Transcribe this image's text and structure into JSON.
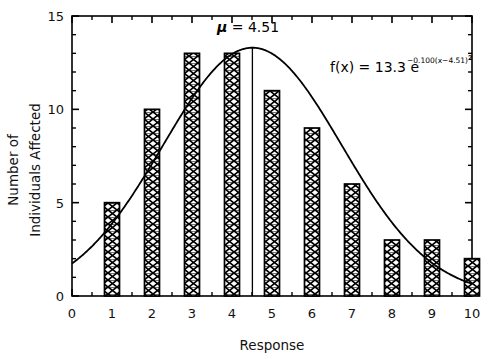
{
  "chart_data": {
    "type": "bar",
    "title": "",
    "xlabel": "Response",
    "ylabel": "Number of Individuals Affected",
    "ylabel_line1": "Number of",
    "ylabel_line2": "Individuals Affected",
    "categories": [
      "1",
      "2",
      "3",
      "4",
      "5",
      "6",
      "7",
      "8",
      "9",
      "10"
    ],
    "values": [
      5,
      10,
      13,
      13,
      11,
      9,
      6,
      3,
      3,
      2
    ],
    "x": [
      1,
      2,
      3,
      4,
      5,
      6,
      7,
      8,
      9,
      10
    ],
    "xlim": [
      0,
      10
    ],
    "ylim": [
      0,
      15
    ],
    "xticks": [
      "0",
      "1",
      "2",
      "3",
      "4",
      "5",
      "6",
      "7",
      "8",
      "9",
      "10"
    ],
    "yticks": [
      "0",
      "5",
      "10",
      "15"
    ],
    "y_minor_step": 1,
    "x_minor_step": 0.5,
    "grid": false,
    "legend": "none",
    "series": [
      {
        "name": "Number of Individuals Affected",
        "type": "bar",
        "values": [
          5,
          10,
          13,
          13,
          11,
          9,
          6,
          3,
          3,
          2
        ]
      },
      {
        "name": "Gaussian fit",
        "type": "line",
        "equation": "f(x) = 13.3 e^(-0.100(x-4.51)^2)",
        "amplitude": 13.3,
        "rate": 0.1,
        "mean": 4.51
      }
    ],
    "annotations": [
      {
        "name": "mean-label",
        "text": "μ  =  4.51",
        "x": 4.51,
        "y": 14.2
      },
      {
        "name": "mean-line",
        "text": "",
        "x": 4.51,
        "y_from": 0,
        "y_to": 13.3
      }
    ],
    "equation": {
      "fx": "f(x)",
      "equals": "=",
      "amplitude": "13.3",
      "base": "e",
      "exponent_main": "−0.100(x−4.51)",
      "exponent_power": "2"
    },
    "mean_symbol": "μ",
    "mean_equals": "=",
    "mean_value": "4.51",
    "bar_fill_pattern": "bowtie-hatch",
    "colors": {
      "axis": "#000000",
      "bar_edge": "#000000",
      "bar_fill": "#ffffff",
      "curve": "#000000",
      "background": "#ffffff"
    }
  }
}
